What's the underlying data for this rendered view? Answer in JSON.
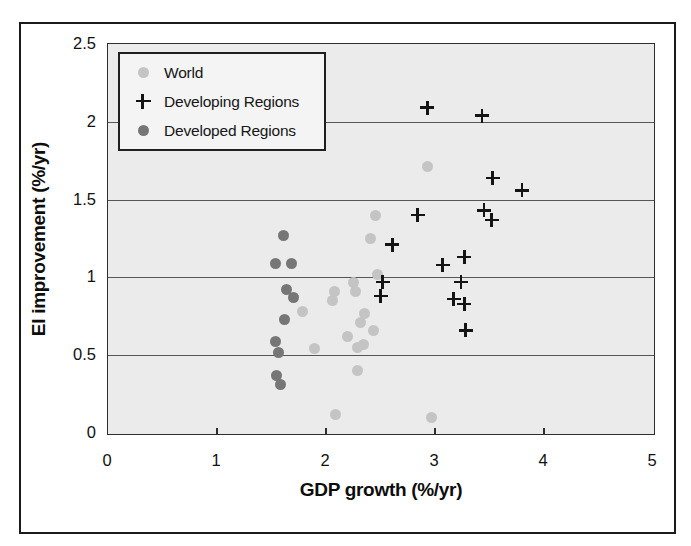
{
  "figure": {
    "x_axis_title": "GDP growth (%/yr)",
    "y_axis_title": "EI improvement (%/yr)"
  },
  "legend": {
    "position": "top-left",
    "items": [
      {
        "label": "World",
        "marker": "circle",
        "color": "#c4c4c4"
      },
      {
        "label": "Developing Regions",
        "marker": "plus",
        "color": "#141414"
      },
      {
        "label": "Developed Regions",
        "marker": "circle",
        "color": "#767676"
      }
    ]
  },
  "colors": {
    "plot_background": "#ebebeb",
    "grid": "#565656",
    "frame": "#2e2e2e",
    "world_marker": "#c4c4c4",
    "developing_marker": "#141414",
    "developed_marker": "#767676"
  },
  "chart_data": {
    "type": "scatter",
    "title": "",
    "xlabel": "GDP growth (%/yr)",
    "ylabel": "EI improvement (%/yr)",
    "xlim": [
      0,
      5
    ],
    "ylim": [
      0,
      2.5
    ],
    "x_tick_labels": [
      "0",
      "1",
      "2",
      "3",
      "4",
      "5"
    ],
    "y_tick_labels": [
      "0",
      "0.5",
      "1",
      "1.5",
      "2",
      "2.5"
    ],
    "gridlines_y": [
      0.5,
      1.0,
      1.5,
      2.0
    ],
    "grid": "horizontal-only",
    "legend_position": "top-left",
    "series": [
      {
        "name": "World",
        "marker": "circle",
        "color": "#c4c4c4",
        "points": [
          [
            2.93,
            1.71
          ],
          [
            2.45,
            1.4
          ],
          [
            2.41,
            1.25
          ],
          [
            2.47,
            1.02
          ],
          [
            2.25,
            0.97
          ],
          [
            2.27,
            0.91
          ],
          [
            2.08,
            0.91
          ],
          [
            2.06,
            0.85
          ],
          [
            2.35,
            0.77
          ],
          [
            1.78,
            0.78
          ],
          [
            2.32,
            0.71
          ],
          [
            2.44,
            0.66
          ],
          [
            2.2,
            0.62
          ],
          [
            2.34,
            0.57
          ],
          [
            2.29,
            0.55
          ],
          [
            1.89,
            0.54
          ],
          [
            2.29,
            0.4
          ],
          [
            2.09,
            0.12
          ],
          [
            2.97,
            0.1
          ]
        ]
      },
      {
        "name": "Developing Regions",
        "marker": "plus",
        "color": "#141414",
        "points": [
          [
            2.93,
            2.09
          ],
          [
            3.43,
            2.04
          ],
          [
            3.53,
            1.64
          ],
          [
            3.8,
            1.56
          ],
          [
            3.45,
            1.43
          ],
          [
            2.84,
            1.4
          ],
          [
            3.52,
            1.37
          ],
          [
            2.61,
            1.21
          ],
          [
            3.27,
            1.13
          ],
          [
            3.07,
            1.08
          ],
          [
            3.24,
            0.97
          ],
          [
            2.52,
            0.97
          ],
          [
            2.5,
            0.88
          ],
          [
            3.17,
            0.86
          ],
          [
            3.27,
            0.83
          ],
          [
            3.28,
            0.66
          ]
        ]
      },
      {
        "name": "Developed Regions",
        "marker": "circle",
        "color": "#767676",
        "points": [
          [
            1.61,
            1.27
          ],
          [
            1.54,
            1.09
          ],
          [
            1.68,
            1.09
          ],
          [
            1.64,
            0.92
          ],
          [
            1.7,
            0.87
          ],
          [
            1.62,
            0.73
          ],
          [
            1.54,
            0.59
          ],
          [
            1.56,
            0.52
          ],
          [
            1.55,
            0.37
          ],
          [
            1.58,
            0.31
          ]
        ]
      }
    ]
  }
}
